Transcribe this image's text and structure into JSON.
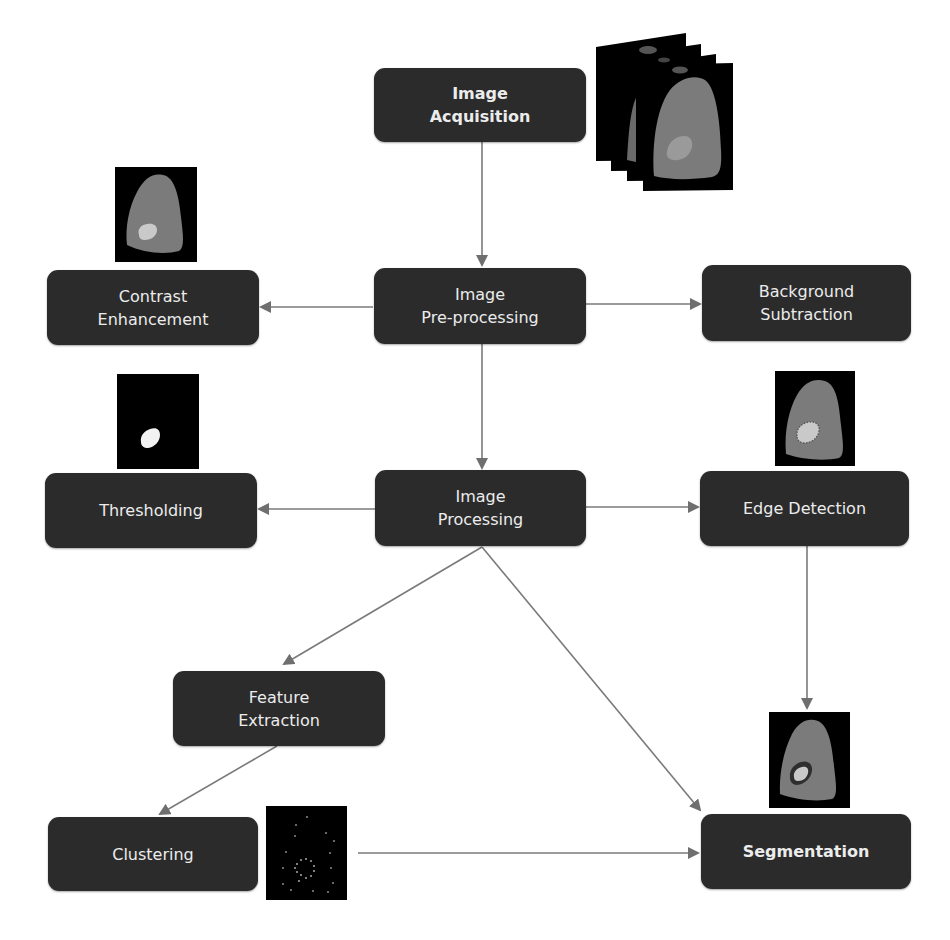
{
  "diagram": {
    "nodes": [
      {
        "id": "image-acquisition",
        "lines": [
          "Image",
          "Acquisition"
        ],
        "bold": true
      },
      {
        "id": "image-preprocessing",
        "lines": [
          "Image",
          "Pre-processing"
        ],
        "bold": false
      },
      {
        "id": "contrast-enhancement",
        "lines": [
          "Contrast",
          "Enhancement"
        ],
        "bold": false
      },
      {
        "id": "background-subtraction",
        "lines": [
          "Background",
          "Subtraction"
        ],
        "bold": false
      },
      {
        "id": "image-processing",
        "lines": [
          "Image",
          "Processing"
        ],
        "bold": false
      },
      {
        "id": "thresholding",
        "lines": [
          "Thresholding"
        ],
        "bold": false
      },
      {
        "id": "edge-detection",
        "lines": [
          "Edge Detection"
        ],
        "bold": false
      },
      {
        "id": "feature-extraction",
        "lines": [
          "Feature",
          "Extraction"
        ],
        "bold": false
      },
      {
        "id": "clustering",
        "lines": [
          "Clustering"
        ],
        "bold": false
      },
      {
        "id": "segmentation",
        "lines": [
          "Segmentation"
        ],
        "bold": true
      }
    ],
    "edges": [
      {
        "from": "image-acquisition",
        "to": "image-preprocessing"
      },
      {
        "from": "image-preprocessing",
        "to": "contrast-enhancement"
      },
      {
        "from": "image-preprocessing",
        "to": "background-subtraction"
      },
      {
        "from": "image-preprocessing",
        "to": "image-processing"
      },
      {
        "from": "image-processing",
        "to": "thresholding"
      },
      {
        "from": "image-processing",
        "to": "edge-detection"
      },
      {
        "from": "image-processing",
        "to": "feature-extraction"
      },
      {
        "from": "image-processing",
        "to": "segmentation"
      },
      {
        "from": "edge-detection",
        "to": "segmentation"
      },
      {
        "from": "feature-extraction",
        "to": "clustering"
      },
      {
        "from": "clustering",
        "to": "segmentation"
      }
    ],
    "thumbnails": [
      {
        "id": "acquisition-slice-stack",
        "depicts": "stacked scan slices"
      },
      {
        "id": "contrast-enhanced-scan",
        "depicts": "gray organ with light lesion"
      },
      {
        "id": "thresholded-mask",
        "depicts": "white lesion on black"
      },
      {
        "id": "edge-detected-scan",
        "depicts": "organ with dotted lesion edge"
      },
      {
        "id": "clustering-points",
        "depicts": "scattered dots on black"
      },
      {
        "id": "segmented-scan",
        "depicts": "organ with outlined lesion"
      }
    ],
    "colors": {
      "node_fill": "#2b2b2b",
      "node_text": "#ececec",
      "edge": "#7a7a7a",
      "organ": "#7b7b7b",
      "lesion": "#c9c9c9",
      "thumb_bg": "#000000"
    }
  }
}
